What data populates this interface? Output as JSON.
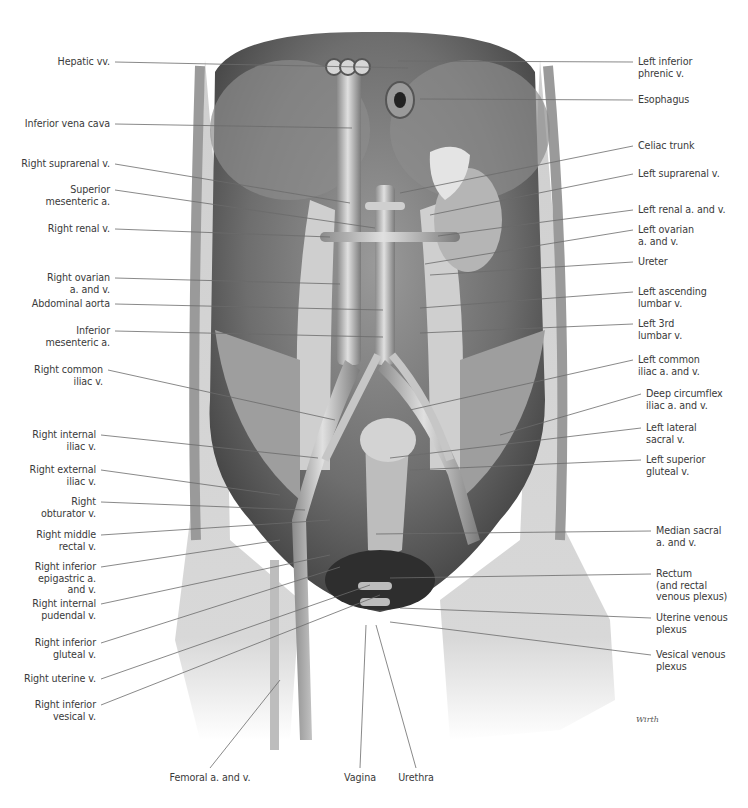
{
  "figure": {
    "type": "anatomical-illustration",
    "signature": "Wirth",
    "colors": {
      "background": "#ffffff",
      "label_text": "#3a3a3a",
      "leader_line": "#6b6b6b",
      "tissue_light": "#d9d9d9",
      "tissue_mid": "#a8a8a8",
      "tissue_dark": "#4a4a4a",
      "vessel": "#bdbdbd"
    }
  },
  "labels": {
    "left": [
      {
        "text": "Hepatic vv.",
        "x": 110,
        "y": 62,
        "tx": 408,
        "ty": 68
      },
      {
        "text": "Inferior vena cava",
        "x": 110,
        "y": 124,
        "tx": 352,
        "ty": 128
      },
      {
        "text": "Right suprarenal v.",
        "x": 110,
        "y": 164,
        "tx": 350,
        "ty": 203
      },
      {
        "text": "Superior\nmesenteric a.",
        "x": 110,
        "y": 190,
        "tx": 375,
        "ty": 228
      },
      {
        "text": "Right renal v.",
        "x": 110,
        "y": 229,
        "tx": 330,
        "ty": 237
      },
      {
        "text": "Right ovarian\na. and v.",
        "x": 110,
        "y": 278,
        "tx": 340,
        "ty": 284
      },
      {
        "text": "Abdominal aorta",
        "x": 110,
        "y": 304,
        "tx": 383,
        "ty": 310
      },
      {
        "text": "Inferior\nmesenteric a.",
        "x": 110,
        "y": 331,
        "tx": 383,
        "ty": 337
      },
      {
        "text": "Right common\niliac v.",
        "x": 103,
        "y": 370,
        "tx": 335,
        "ty": 420
      },
      {
        "text": "Right internal\niliac v.",
        "x": 96,
        "y": 435,
        "tx": 318,
        "ty": 458
      },
      {
        "text": "Right external\niliac v.",
        "x": 96,
        "y": 470,
        "tx": 280,
        "ty": 495
      },
      {
        "text": "Right\nobturator v.",
        "x": 96,
        "y": 502,
        "tx": 305,
        "ty": 510
      },
      {
        "text": "Right middle\nrectal v.",
        "x": 96,
        "y": 535,
        "tx": 330,
        "ty": 520
      },
      {
        "text": "Right inferior\nepigastric a.\nand v.",
        "x": 96,
        "y": 567,
        "tx": 280,
        "ty": 540
      },
      {
        "text": "Right internal\npudendal v.",
        "x": 96,
        "y": 604,
        "tx": 330,
        "ty": 555
      },
      {
        "text": "Right inferior\ngluteal v.",
        "x": 96,
        "y": 643,
        "tx": 340,
        "ty": 567
      },
      {
        "text": "Right uterine v.",
        "x": 96,
        "y": 679,
        "tx": 370,
        "ty": 585
      },
      {
        "text": "Right inferior\nvesical v.",
        "x": 96,
        "y": 705,
        "tx": 380,
        "ty": 595
      }
    ],
    "right": [
      {
        "text": "Left inferior\nphrenic v.",
        "x": 638,
        "y": 62,
        "tx": 398,
        "ty": 61
      },
      {
        "text": "Esophagus",
        "x": 638,
        "y": 100,
        "tx": 420,
        "ty": 99
      },
      {
        "text": "Celiac trunk",
        "x": 638,
        "y": 146,
        "tx": 400,
        "ty": 193
      },
      {
        "text": "Left suprarenal v.",
        "x": 638,
        "y": 174,
        "tx": 430,
        "ty": 215
      },
      {
        "text": "Left renal a. and v.",
        "x": 638,
        "y": 210,
        "tx": 438,
        "ty": 236
      },
      {
        "text": "Left ovarian\na. and v.",
        "x": 638,
        "y": 230,
        "tx": 425,
        "ty": 264
      },
      {
        "text": "Ureter",
        "x": 638,
        "y": 262,
        "tx": 430,
        "ty": 275
      },
      {
        "text": "Left ascending\nlumbar v.",
        "x": 638,
        "y": 292,
        "tx": 420,
        "ty": 308
      },
      {
        "text": "Left 3rd\nlumbar v.",
        "x": 638,
        "y": 324,
        "tx": 420,
        "ty": 333
      },
      {
        "text": "Left common\niliac a. and v.",
        "x": 638,
        "y": 360,
        "tx": 410,
        "ty": 410
      },
      {
        "text": "Deep circumflex\niliac a. and v.",
        "x": 646,
        "y": 394,
        "tx": 500,
        "ty": 435
      },
      {
        "text": "Left lateral\nsacral v.",
        "x": 646,
        "y": 428,
        "tx": 390,
        "ty": 458
      },
      {
        "text": "Left superior\ngluteal v.",
        "x": 646,
        "y": 460,
        "tx": 410,
        "ty": 470
      },
      {
        "text": "Median sacral\na. and v.",
        "x": 656,
        "y": 531,
        "tx": 376,
        "ty": 534
      },
      {
        "text": "Rectum\n(and rectal\nvenous plexus)",
        "x": 656,
        "y": 574,
        "tx": 390,
        "ty": 578
      },
      {
        "text": "Uterine venous\nplexus",
        "x": 656,
        "y": 618,
        "tx": 400,
        "ty": 608
      },
      {
        "text": "Vesical venous\nplexus",
        "x": 656,
        "y": 655,
        "tx": 390,
        "ty": 622
      }
    ],
    "bottom": [
      {
        "text": "Femoral a. and v.",
        "x": 210,
        "y": 772,
        "tx": 280,
        "ty": 680
      },
      {
        "text": "Vagina",
        "x": 360,
        "y": 772,
        "tx": 366,
        "ty": 625
      },
      {
        "text": "Urethra",
        "x": 416,
        "y": 772,
        "tx": 376,
        "ty": 625
      }
    ]
  }
}
